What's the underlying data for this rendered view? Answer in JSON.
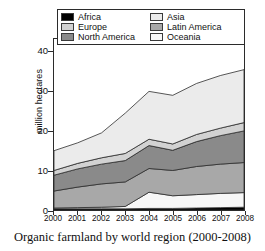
{
  "caption": "Organic farmland by world region (2000-2008)",
  "axes": {
    "ylabel": "million hectares",
    "yticks": [
      "0",
      "10",
      "20",
      "30",
      "40"
    ],
    "ytick_values": [
      0,
      10,
      20,
      30,
      40
    ],
    "xticks": [
      "2000",
      "2001",
      "2002",
      "2003",
      "2004",
      "2005",
      "2006",
      "2007",
      "2008"
    ]
  },
  "legend": {
    "left": [
      {
        "label": "Africa",
        "color": "#000000"
      },
      {
        "label": "Europe",
        "color": "#d2d2d2"
      },
      {
        "label": "North America",
        "color": "#8a8a8a"
      }
    ],
    "right": [
      {
        "label": "Asia",
        "color": "#ebebeb"
      },
      {
        "label": "Latin America",
        "color": "#a8a8a8"
      },
      {
        "label": "Oceania",
        "color": "#f7f7f7"
      }
    ]
  },
  "chart_data": {
    "type": "area",
    "title": "Organic farmland by world region (2000-2008)",
    "xlabel": "",
    "ylabel": "million hectares",
    "x": [
      2000,
      2001,
      2002,
      2003,
      2004,
      2005,
      2006,
      2007,
      2008
    ],
    "xlim": [
      2000,
      2008
    ],
    "ylim": [
      0,
      40
    ],
    "stacked": true,
    "grid": false,
    "legend_position": "top-inside",
    "series": [
      {
        "name": "Africa",
        "color": "#000000",
        "values": [
          0.3,
          0.3,
          0.3,
          0.3,
          0.4,
          0.4,
          0.5,
          0.6,
          0.7
        ]
      },
      {
        "name": "Oceania",
        "color": "#f7f7f7",
        "values": [
          0.2,
          0.3,
          0.4,
          0.6,
          4.1,
          3.2,
          3.4,
          3.6,
          3.7
        ]
      },
      {
        "name": "Latin America",
        "color": "#a8a8a8",
        "values": [
          4.3,
          5.2,
          5.9,
          6.2,
          6.0,
          6.4,
          7.1,
          7.4,
          7.6
        ]
      },
      {
        "name": "North America",
        "color": "#8a8a8a",
        "values": [
          4.0,
          4.6,
          5.0,
          5.4,
          5.8,
          5.1,
          6.3,
          7.2,
          8.0
        ]
      },
      {
        "name": "Europe",
        "color": "#d2d2d2",
        "values": [
          1.2,
          1.4,
          1.6,
          1.8,
          1.6,
          1.6,
          1.8,
          1.9,
          2.1
        ]
      },
      {
        "name": "Asia",
        "color": "#ebebeb",
        "values": [
          5.0,
          5.2,
          6.3,
          10.2,
          12.1,
          12.3,
          12.9,
          13.3,
          13.4
        ]
      }
    ],
    "totals": [
      15.0,
      17.0,
      19.5,
      24.5,
      30.0,
      29.0,
      32.0,
      34.0,
      35.5
    ]
  }
}
